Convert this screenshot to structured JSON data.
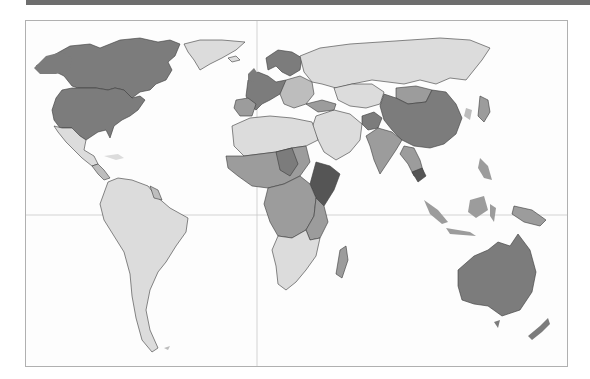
{
  "map": {
    "type": "world-choropleth",
    "projection": "equirectangular-like",
    "frame": {
      "x": 25,
      "y": 20,
      "width": 543,
      "height": 347
    },
    "gridlines": {
      "equator_y": 215,
      "prime_meridian_x": 257
    },
    "legend_visible": false,
    "shade_levels": {
      "l1": "#dcdcdc",
      "l2": "#bdbdbd",
      "l3": "#9c9c9c",
      "l4": "#7c7c7c",
      "l5": "#555555"
    },
    "regions": [
      {
        "name": "North America (USA, Canada)",
        "shade": "l4"
      },
      {
        "name": "Greenland",
        "shade": "l1"
      },
      {
        "name": "Mexico & Central America",
        "shade": "l1"
      },
      {
        "name": "South America",
        "shade": "l1"
      },
      {
        "name": "Western Europe",
        "shade": "l4"
      },
      {
        "name": "Eastern Europe",
        "shade": "l2"
      },
      {
        "name": "Russia",
        "shade": "l1"
      },
      {
        "name": "North Africa",
        "shade": "l1"
      },
      {
        "name": "Sahel / West Africa",
        "shade": "l3"
      },
      {
        "name": "East Africa (Ethiopia, Somalia)",
        "shade": "l5"
      },
      {
        "name": "Southern Africa",
        "shade": "l1"
      },
      {
        "name": "Madagascar",
        "shade": "l3"
      },
      {
        "name": "Middle East",
        "shade": "l1"
      },
      {
        "name": "Central Asia",
        "shade": "l1"
      },
      {
        "name": "Afghanistan",
        "shade": "l4"
      },
      {
        "name": "India",
        "shade": "l3"
      },
      {
        "name": "China",
        "shade": "l4"
      },
      {
        "name": "Mongolia",
        "shade": "l3"
      },
      {
        "name": "Southeast Asia",
        "shade": "l3"
      },
      {
        "name": "Cambodia",
        "shade": "l5"
      },
      {
        "name": "Japan",
        "shade": "l3"
      },
      {
        "name": "Indonesia",
        "shade": "l3"
      },
      {
        "name": "Australia",
        "shade": "l4"
      },
      {
        "name": "New Zealand",
        "shade": "l4"
      }
    ]
  }
}
